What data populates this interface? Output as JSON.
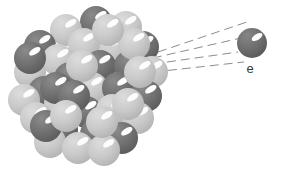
{
  "figure": {
    "background_color": "#ffffff",
    "width": 286,
    "height": 172
  },
  "nucleus": {
    "name": "nucleus-cluster",
    "center_x": 86,
    "center_y": 84,
    "radius": 74,
    "particle_radius": 16,
    "colors": {
      "dark_particle": "#6f6f6f",
      "dark_particle_shade": "#5d5d5d",
      "light_particle": "#cbcbcb",
      "light_particle_shade": "#b6b6b6",
      "highlight": "#fdfdfd"
    },
    "particles": [
      {
        "x": 96,
        "y": 22,
        "type": "dark"
      },
      {
        "x": 126,
        "y": 27,
        "type": "light"
      },
      {
        "x": 66,
        "y": 30,
        "type": "light"
      },
      {
        "x": 40,
        "y": 46,
        "type": "dark"
      },
      {
        "x": 112,
        "y": 48,
        "type": "light"
      },
      {
        "x": 143,
        "y": 47,
        "type": "dark"
      },
      {
        "x": 84,
        "y": 44,
        "type": "light"
      },
      {
        "x": 30,
        "y": 72,
        "type": "light"
      },
      {
        "x": 58,
        "y": 60,
        "type": "light"
      },
      {
        "x": 100,
        "y": 66,
        "type": "dark"
      },
      {
        "x": 130,
        "y": 66,
        "type": "dark"
      },
      {
        "x": 152,
        "y": 72,
        "type": "light"
      },
      {
        "x": 70,
        "y": 78,
        "type": "dark"
      },
      {
        "x": 44,
        "y": 92,
        "type": "dark"
      },
      {
        "x": 24,
        "y": 100,
        "type": "light"
      },
      {
        "x": 92,
        "y": 88,
        "type": "light"
      },
      {
        "x": 118,
        "y": 88,
        "type": "dark"
      },
      {
        "x": 146,
        "y": 96,
        "type": "dark"
      },
      {
        "x": 60,
        "y": 104,
        "type": "light"
      },
      {
        "x": 86,
        "y": 112,
        "type": "dark"
      },
      {
        "x": 112,
        "y": 110,
        "type": "light"
      },
      {
        "x": 138,
        "y": 118,
        "type": "light"
      },
      {
        "x": 36,
        "y": 118,
        "type": "light"
      },
      {
        "x": 62,
        "y": 130,
        "type": "dark"
      },
      {
        "x": 96,
        "y": 134,
        "type": "dark"
      },
      {
        "x": 122,
        "y": 138,
        "type": "dark"
      },
      {
        "x": 50,
        "y": 142,
        "type": "light"
      },
      {
        "x": 78,
        "y": 148,
        "type": "light"
      },
      {
        "x": 104,
        "y": 150,
        "type": "light"
      },
      {
        "x": 82,
        "y": 66,
        "type": "light"
      },
      {
        "x": 56,
        "y": 88,
        "type": "dark"
      },
      {
        "x": 134,
        "y": 44,
        "type": "light"
      },
      {
        "x": 108,
        "y": 30,
        "type": "light"
      },
      {
        "x": 74,
        "y": 96,
        "type": "dark"
      },
      {
        "x": 140,
        "y": 72,
        "type": "light"
      },
      {
        "x": 30,
        "y": 58,
        "type": "dark"
      },
      {
        "x": 46,
        "y": 126,
        "type": "dark"
      },
      {
        "x": 102,
        "y": 122,
        "type": "light"
      },
      {
        "x": 128,
        "y": 104,
        "type": "light"
      },
      {
        "x": 66,
        "y": 116,
        "type": "light"
      }
    ]
  },
  "electron": {
    "name": "electron-particle",
    "x": 252,
    "y": 43,
    "radius": 15,
    "color": "#6f6f6f",
    "highlight_color": "#fdfdfd",
    "label": "e",
    "label_x": 250,
    "label_y": 73
  },
  "trajectory": {
    "name": "electron-trajectory-lines",
    "color": "#8d8d8d",
    "dash_pattern": "9 5",
    "stroke_width": 1,
    "lines": [
      {
        "x1": 158,
        "y1": 52,
        "x2": 247,
        "y2": 22
      },
      {
        "x1": 153,
        "y1": 58,
        "x2": 241,
        "y2": 38
      },
      {
        "x1": 153,
        "y1": 64,
        "x2": 238,
        "y2": 52
      },
      {
        "x1": 154,
        "y1": 72,
        "x2": 244,
        "y2": 62
      }
    ]
  }
}
